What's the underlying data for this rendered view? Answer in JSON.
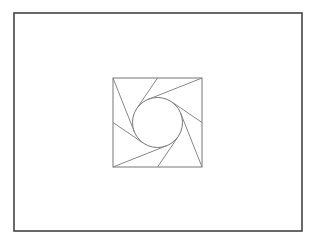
{
  "diagram": {
    "type": "geometric-construction",
    "frame": {
      "x": 14,
      "y": 13,
      "width": 288,
      "height": 218,
      "stroke": "#444444",
      "stroke_width": 1.6
    },
    "square": {
      "x": 113,
      "y": 78,
      "width": 89,
      "height": 89,
      "stroke": "#777777",
      "stroke_width": 1
    },
    "circle": {
      "cx": 157.5,
      "cy": 122.5,
      "r": 25,
      "stroke": "#777777",
      "stroke_width": 1
    },
    "tangent_lines": [
      {
        "from": [
          113,
          78
        ],
        "to": [
          134.3,
          131.7
        ]
      },
      {
        "from": [
          157.5,
          78
        ],
        "to": [
          136.8,
          108.4
        ]
      },
      {
        "from": [
          202,
          78
        ],
        "to": [
          148.3,
          99.3
        ]
      },
      {
        "from": [
          202,
          122.5
        ],
        "to": [
          171.6,
          101.8
        ]
      },
      {
        "from": [
          202,
          167
        ],
        "to": [
          180.7,
          113.3
        ]
      },
      {
        "from": [
          157.5,
          167
        ],
        "to": [
          178.2,
          136.6
        ]
      },
      {
        "from": [
          113,
          167
        ],
        "to": [
          166.7,
          145.7
        ]
      },
      {
        "from": [
          113,
          122.5
        ],
        "to": [
          143.4,
          143.2
        ]
      }
    ],
    "line_stroke": "#888888",
    "line_width": 1
  }
}
